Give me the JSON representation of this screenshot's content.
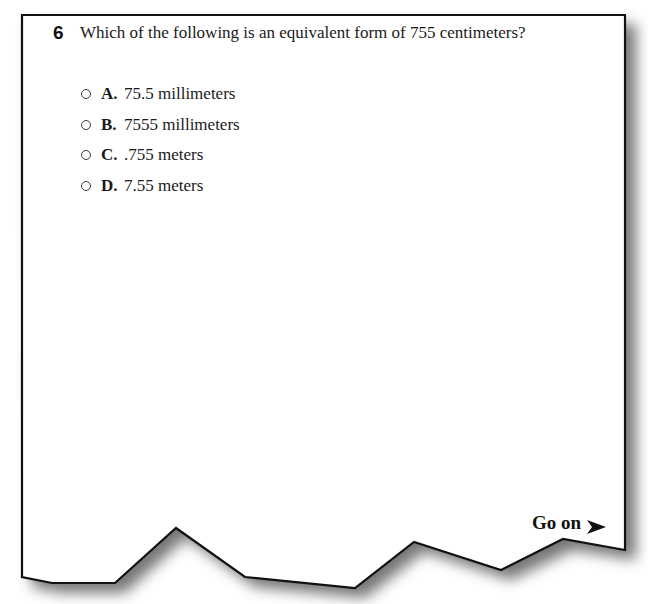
{
  "question": {
    "number": "6",
    "text": "Which of the following is an equivalent form of 755 centimeters?",
    "options": [
      {
        "letter": "A.",
        "text": "75.5 millimeters",
        "selected": false
      },
      {
        "letter": "B.",
        "text": "7555 millimeters",
        "selected": false
      },
      {
        "letter": "C.",
        "text": ".755 meters",
        "selected": false
      },
      {
        "letter": "D.",
        "text": "7.55 meters",
        "selected": false
      }
    ]
  },
  "footer": {
    "go_on_label": "Go on",
    "go_on_icon": "arrow-right-icon"
  },
  "colors": {
    "page_background": "#ffffff",
    "border": "#111111",
    "shadow": "#6e6e6e",
    "text": "#1a1a1a"
  }
}
